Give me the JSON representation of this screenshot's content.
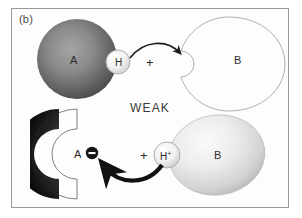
{
  "figure": {
    "panel_label": "(b)",
    "middle_label": "WEAK",
    "border_color": "#9a9a9a",
    "background": "#ffffff"
  },
  "top_row": {
    "donor_label": "A",
    "hydrogen_label": "H",
    "plus_label": "+",
    "acceptor_label": "B",
    "donor_color_light": "#8d8d8d",
    "donor_color_dark": "#4a4a4a",
    "acceptor_color_light": "#ededed",
    "acceptor_color_dark": "#a8a8a8",
    "hydrogen_color": "#f2f2f2",
    "arrow_color": "#1a1a1a",
    "arrow_style": "thin"
  },
  "bottom_row": {
    "donor_label": "A",
    "charge_label": "−",
    "plus_label": "+",
    "hydrogen_label": "H",
    "hydrogen_charge": "+",
    "acceptor_label": "B",
    "donor_color_light": "#6e6e6e",
    "donor_color_dark": "#080808",
    "acceptor_color_light": "#f0f0f0",
    "acceptor_color_dark": "#bdbdbd",
    "hydrogen_color": "#f2f2f2",
    "arrow_color": "#111111",
    "arrow_style": "thick"
  },
  "icons": {
    "top_arrow": "curved-arrow-right-icon",
    "bottom_arrow": "curved-arrow-left-icon",
    "negative_charge": "minus-charge-icon"
  }
}
